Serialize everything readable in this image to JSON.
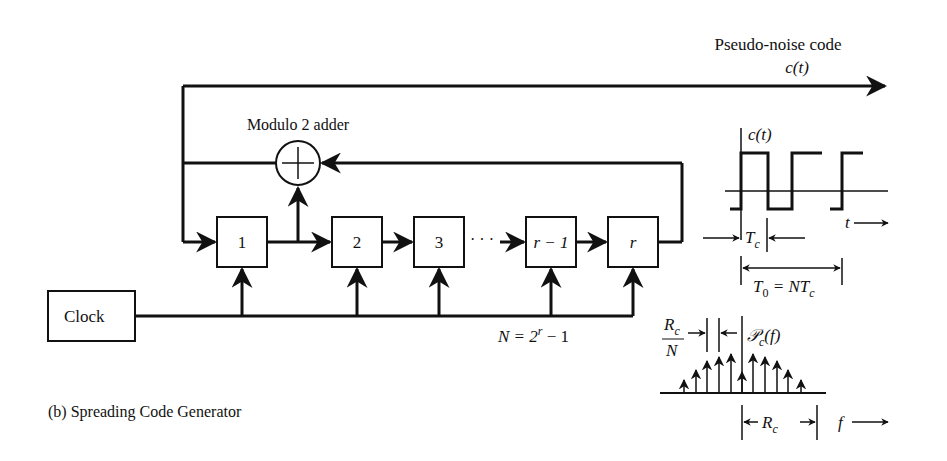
{
  "title": "Pseudo-noise code",
  "output_signal": "c(t)",
  "adder_label": "Modulo 2 adder",
  "clock_label": "Clock",
  "registers": [
    "1",
    "2",
    "3",
    "r − 1",
    "r"
  ],
  "dots": "· · ·",
  "sequence_length": "N = 2",
  "sequence_length_exp": "r",
  "sequence_length_tail": " − 1",
  "caption": "(b) Spreading Code Generator",
  "waveform": {
    "ylabel": "c(t)",
    "xlabel": "t",
    "chip_label": "T",
    "chip_sub": "c",
    "period_label": "T",
    "period_sub": "0",
    "period_eq": " = NT",
    "period_eq_sub": "c"
  },
  "spectrum": {
    "label": "𝒫",
    "label_sub": "c",
    "label_tail": "(f)",
    "spacing_num": "R",
    "spacing_num_sub": "c",
    "spacing_den": "N",
    "width_label": "R",
    "width_sub": "c",
    "xlabel": "f"
  },
  "colors": {
    "ink": "#111111",
    "background": "#ffffff"
  }
}
